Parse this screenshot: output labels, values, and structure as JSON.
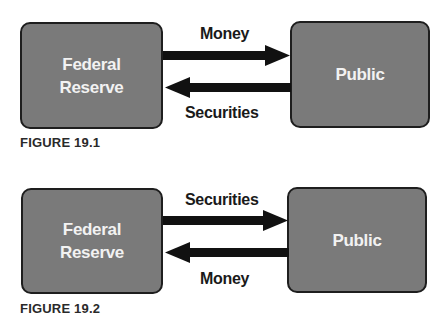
{
  "figures": [
    {
      "left_box": {
        "line1": "Federal",
        "line2": "Reserve"
      },
      "right_box": {
        "label": "Public"
      },
      "top_arrow": {
        "label": "Money",
        "direction": "right"
      },
      "bottom_arrow": {
        "label": "Securities",
        "direction": "left"
      },
      "caption": "FIGURE 19.1"
    },
    {
      "left_box": {
        "line1": "Federal",
        "line2": "Reserve"
      },
      "right_box": {
        "label": "Public"
      },
      "top_arrow": {
        "label": "Securities",
        "direction": "right"
      },
      "bottom_arrow": {
        "label": "Money",
        "direction": "left"
      },
      "caption": "FIGURE 19.2"
    }
  ],
  "colors": {
    "box_fill": "#7a7a7a",
    "box_border": "#1e1e1e",
    "arrow": "#111111",
    "box_text": "#f2f2f2"
  }
}
